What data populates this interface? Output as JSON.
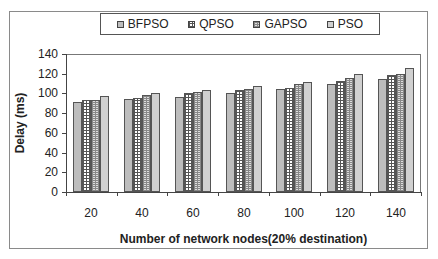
{
  "chart_data": {
    "type": "bar",
    "title": "",
    "xlabel": "Number of network nodes(20% destination)",
    "ylabel": "Delay (ms)",
    "categories": [
      "20",
      "40",
      "60",
      "80",
      "100",
      "120",
      "140"
    ],
    "series": [
      {
        "name": "BFPSO",
        "values": [
          91,
          94,
          96,
          100,
          104,
          110,
          115
        ]
      },
      {
        "name": "QPSO",
        "values": [
          93,
          95,
          100,
          103,
          106,
          113,
          119
        ]
      },
      {
        "name": "GAPSO",
        "values": [
          93,
          98,
          101,
          104,
          110,
          116,
          120
        ]
      },
      {
        "name": "PSO",
        "values": [
          97,
          100,
          103,
          108,
          112,
          120,
          126
        ]
      }
    ],
    "ylim": [
      0,
      140
    ],
    "yticks": [
      "0",
      "20",
      "40",
      "60",
      "80",
      "100",
      "120",
      "140"
    ],
    "grid": false,
    "legend_position": "top"
  },
  "legend": {
    "items": [
      {
        "label": "BFPSO"
      },
      {
        "label": "QPSO"
      },
      {
        "label": "GAPSO"
      },
      {
        "label": "PSO"
      }
    ]
  }
}
